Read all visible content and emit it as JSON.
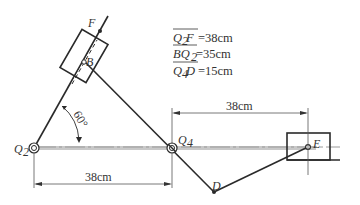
{
  "diagram": {
    "type": "mechanism-linkage",
    "points": {
      "Q2": {
        "label": "Q",
        "sub": "2",
        "x": 34,
        "y": 148
      },
      "Q4": {
        "label": "Q",
        "sub": "4",
        "x": 172,
        "y": 148
      },
      "B": {
        "label": "B",
        "x": 85,
        "y": 61
      },
      "F": {
        "label": "F",
        "x": 100,
        "y": 31
      },
      "D": {
        "label": "D",
        "x": 214,
        "y": 192
      },
      "E": {
        "label": "E",
        "x": 308,
        "y": 147
      }
    },
    "angle": {
      "label": "60°",
      "value": 60
    },
    "dimensions": {
      "bottom": {
        "label": "38cm"
      },
      "top": {
        "label": "38cm"
      }
    },
    "notes": [
      {
        "overline": "Q2F",
        "main": "Q",
        "sub": "2",
        "tail": " F",
        "value": "=38cm"
      },
      {
        "overline": "BQ2",
        "main": "BQ",
        "sub": "2",
        "tail": "",
        "value": " =35cm"
      },
      {
        "overline": "Q4D",
        "main": "Q",
        "sub": "4",
        "tail": " D",
        "value": "=15cm"
      }
    ],
    "colors": {
      "line": "#2a2a2a",
      "ground": "#9a9a9a",
      "text": "#333333"
    }
  }
}
